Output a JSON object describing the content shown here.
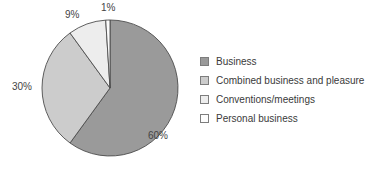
{
  "chart_data": {
    "type": "pie",
    "title": "",
    "subtitle": "",
    "xlabel": "",
    "ylabel": "",
    "grid": false,
    "legend_position": "right",
    "start_angle_deg": 0,
    "direction": "clockwise",
    "categories": [
      "Business",
      "Combined business and pleasure",
      "Conventions/meetings",
      "Personal business"
    ],
    "values": [
      60,
      30,
      9,
      1
    ],
    "value_labels": [
      "60%",
      "30%",
      "9%",
      "1%"
    ],
    "colors": [
      "#9a9a9a",
      "#cccccc",
      "#ededed",
      "#fbfbfb"
    ],
    "slice_border_color": "#4d4d4d",
    "label_color": "#444444",
    "background": "#ffffff",
    "slices": [
      {
        "label": "Business",
        "value": 60,
        "display": "60%",
        "color": "#9a9a9a"
      },
      {
        "label": "Combined business and pleasure",
        "value": 30,
        "display": "30%",
        "color": "#cccccc"
      },
      {
        "label": "Conventions/meetings",
        "value": 9,
        "display": "9%",
        "color": "#ededed"
      },
      {
        "label": "Personal business",
        "value": 1,
        "display": "1%",
        "color": "#fbfbfb"
      }
    ]
  },
  "legend": {
    "items": [
      {
        "label": "Business",
        "color": "#9a9a9a"
      },
      {
        "label": "Combined business and pleasure",
        "color": "#cccccc"
      },
      {
        "label": "Conventions/meetings",
        "color": "#ededed"
      },
      {
        "label": "Personal business",
        "color": "#fdfdfd"
      }
    ]
  },
  "labels": {
    "business": "60%",
    "combined": "30%",
    "conventions": "9%",
    "personal": "1%"
  }
}
